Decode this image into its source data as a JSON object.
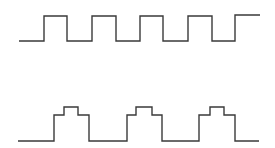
{
  "diagram": {
    "type": "waveform",
    "background": "#ffffff",
    "stroke_color": "#3a3a3a",
    "waveforms": [
      {
        "name": "square-wave",
        "description": "Regular square wave, five high pulses",
        "points": [
          [
            19,
            41
          ],
          [
            44,
            41
          ],
          [
            44,
            16
          ],
          [
            67,
            16
          ],
          [
            67,
            41
          ],
          [
            92,
            41
          ],
          [
            92,
            16
          ],
          [
            116,
            16
          ],
          [
            116,
            41
          ],
          [
            140,
            41
          ],
          [
            140,
            16
          ],
          [
            163,
            16
          ],
          [
            163,
            41
          ],
          [
            188,
            41
          ],
          [
            188,
            16
          ],
          [
            212,
            16
          ],
          [
            212,
            41
          ],
          [
            235,
            41
          ],
          [
            235,
            15
          ],
          [
            260,
            15
          ]
        ]
      },
      {
        "name": "stepped-pulse-wave",
        "description": "Pulse train with two-level stepped tops, three pulses",
        "points": [
          [
            18,
            141
          ],
          [
            54,
            141
          ],
          [
            54,
            115
          ],
          [
            64,
            115
          ],
          [
            64,
            107
          ],
          [
            78,
            107
          ],
          [
            78,
            115
          ],
          [
            89,
            115
          ],
          [
            89,
            141
          ],
          [
            127,
            141
          ],
          [
            127,
            115
          ],
          [
            136,
            115
          ],
          [
            136,
            107
          ],
          [
            152,
            107
          ],
          [
            152,
            115
          ],
          [
            162,
            115
          ],
          [
            162,
            141
          ],
          [
            199,
            141
          ],
          [
            199,
            115
          ],
          [
            210,
            115
          ],
          [
            210,
            107
          ],
          [
            224,
            107
          ],
          [
            224,
            115
          ],
          [
            235,
            115
          ],
          [
            235,
            141
          ],
          [
            259,
            141
          ]
        ]
      }
    ]
  }
}
